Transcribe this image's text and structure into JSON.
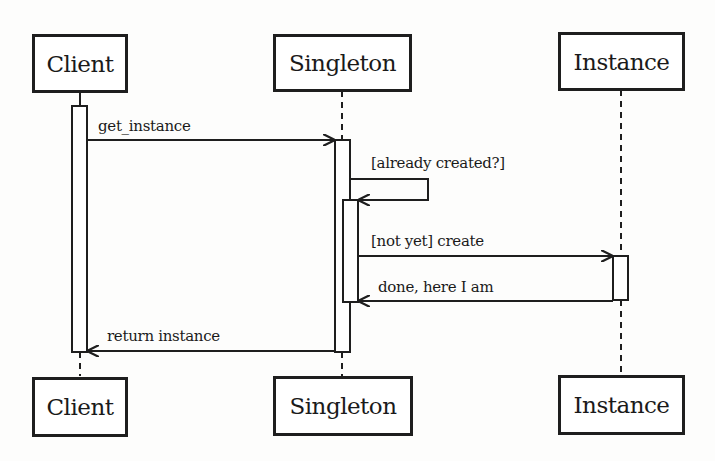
{
  "diagram": {
    "type": "UML sequence diagram",
    "participants": [
      {
        "id": "client",
        "label": "Client"
      },
      {
        "id": "singleton",
        "label": "Singleton"
      },
      {
        "id": "instance",
        "label": "Instance"
      }
    ],
    "messages": [
      {
        "from": "client",
        "to": "singleton",
        "label": "get_instance",
        "kind": "call"
      },
      {
        "from": "singleton",
        "to": "singleton",
        "label": "[already created?]",
        "kind": "self-call"
      },
      {
        "from": "singleton",
        "to": "instance",
        "label": "[not yet] create",
        "kind": "call"
      },
      {
        "from": "instance",
        "to": "singleton",
        "label": "done, here I am",
        "kind": "return"
      },
      {
        "from": "singleton",
        "to": "client",
        "label": "return instance",
        "kind": "return"
      }
    ]
  }
}
